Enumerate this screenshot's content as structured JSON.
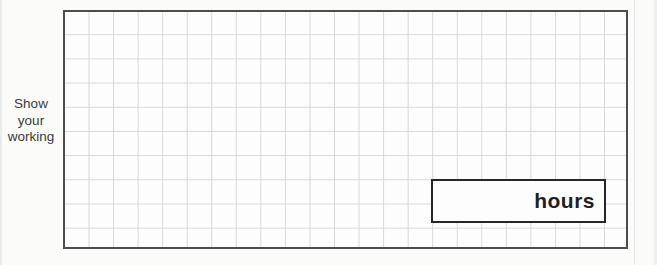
{
  "document": {
    "working_label": "Show\nyour\nworking",
    "answer_box": {
      "unit_label": "hours"
    },
    "grid": {
      "columns": 23,
      "rows": 10
    },
    "colors": {
      "background": "#fbfbfa",
      "grid_line": "#d8d8d8",
      "grid_border": "#4d4d4d",
      "answer_box_border": "#262626",
      "text": "#3a3a3a"
    }
  }
}
